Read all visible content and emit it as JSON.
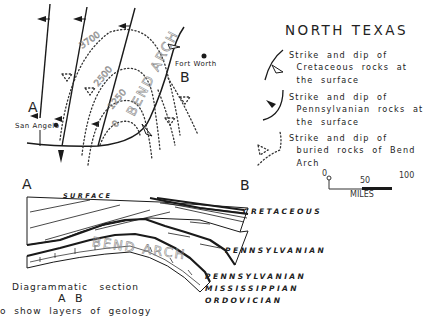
{
  "title": "NORTH TEXAS",
  "map": {
    "cities": [
      {
        "name": "San Angelo"
      },
      {
        "name": "Fort Worth"
      }
    ],
    "section_endpoints": {
      "a": "A",
      "b": "B"
    },
    "contours": [
      "3700",
      "2500",
      "1250",
      "0"
    ],
    "arch_label": "BEND ARCH"
  },
  "legend": [
    {
      "symbol": "cretaceous-strike-dip",
      "text": "Strike  and  dip  of\n  Cretaceous  rocks  at\n  the  surface"
    },
    {
      "symbol": "pennsylvanian-strike-dip",
      "text": "Strike  and  dip  of\n  Pennsylvanian  rocks  at\n  the  surface"
    },
    {
      "symbol": "buried-strike-dip",
      "text": "Strike  and  dip  of\n  buried  rocks  of  Bend\n  Arch"
    }
  ],
  "scale": {
    "start": "0",
    "mid": "50",
    "end": "100",
    "unit": "MILES"
  },
  "section": {
    "left_label": "A",
    "right_label": "B",
    "surface_label": "SURFACE",
    "arch_label": "BEND ARCH",
    "layers": [
      "CRETACEOUS",
      "PENNSYLVANIAN",
      "PENNSYLVANIAN",
      "MISSISSIPPIAN",
      "ORDOVICIAN"
    ]
  },
  "caption": {
    "line1": "Diagrammatic   section",
    "line2": "A B",
    "line3": "o  show  layers  of  geology"
  }
}
